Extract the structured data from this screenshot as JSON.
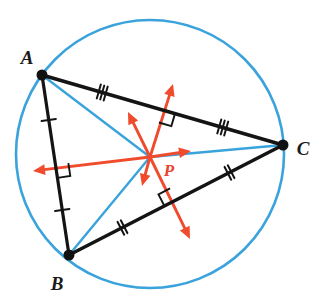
{
  "figure": {
    "background_color": "#ffffff",
    "width": 331,
    "height": 301
  },
  "colors": {
    "circle": "#3aa3dc",
    "triangle": "#141414",
    "radius": "#3aa3dc",
    "bisector": "#ef4b2c",
    "vertex_dot": "#111111",
    "label": "#1a1a1a",
    "center_label": "#e8452c"
  },
  "circle": {
    "name": "circumscribed-circle",
    "center": {
      "x": 150,
      "y": 154
    },
    "radius": 134,
    "stroke_width": 2.6
  },
  "vertices": [
    {
      "id": "A",
      "label": "A",
      "x": 42,
      "y": 75,
      "label_x": 27,
      "label_y": 64,
      "dot_radius": 5.5
    },
    {
      "id": "B",
      "label": "B",
      "x": 69,
      "y": 255,
      "label_x": 57,
      "label_y": 290,
      "dot_radius": 5.5
    },
    {
      "id": "C",
      "label": "C",
      "x": 283,
      "y": 145,
      "label_x": 303,
      "label_y": 155,
      "dot_radius": 5.5
    }
  ],
  "center_point": {
    "id": "P",
    "label": "P",
    "x": 150,
    "y": 157,
    "label_x": 169,
    "label_y": 176
  },
  "triangle_sides": [
    {
      "name": "side-AB",
      "from": "A",
      "to": "B",
      "tick_count": 1,
      "stroke_width": 3.2
    },
    {
      "name": "side-BC",
      "from": "B",
      "to": "C",
      "tick_count": 2,
      "stroke_width": 3.6
    },
    {
      "name": "side-AC",
      "from": "A",
      "to": "C",
      "tick_count": 3,
      "stroke_width": 3.6
    }
  ],
  "radii": [
    {
      "name": "radius-PA",
      "from": "P",
      "to": "A",
      "stroke_width": 2.4
    },
    {
      "name": "radius-PB",
      "from": "P",
      "to": "B",
      "stroke_width": 2.4
    },
    {
      "name": "radius-PC",
      "from": "P",
      "to": "C",
      "stroke_width": 2.4
    }
  ],
  "midpoints": [
    {
      "name": "midpoint-AB",
      "side": "AB",
      "x": 55.5,
      "y": 165
    },
    {
      "name": "midpoint-BC",
      "side": "BC",
      "x": 176,
      "y": 200
    },
    {
      "name": "midpoint-AC",
      "side": "AC",
      "x": 162.5,
      "y": 110
    }
  ],
  "perpendicular_bisectors": [
    {
      "name": "bisector-AB",
      "side": "AB",
      "arrow_long": {
        "x": 33,
        "y": 171
      },
      "arrow_short": {
        "x": 191,
        "y": 151
      },
      "arrow_heads": "both"
    },
    {
      "name": "bisector-AC",
      "side": "AC",
      "arrow_long": {
        "x": 173,
        "y": 84
      },
      "arrow_short": {
        "x": 128,
        "y": 112
      },
      "arrow_heads": "both"
    },
    {
      "name": "bisector-BC",
      "side": "BC",
      "arrow_long": {
        "x": 190,
        "y": 239
      },
      "arrow_short": {
        "x": 142,
        "y": 186
      },
      "arrow_heads": "both"
    }
  ],
  "right_angle_marks": [
    {
      "name": "right-angle-AB",
      "at_side": "AB",
      "size": 13
    },
    {
      "name": "right-angle-AC",
      "at_side": "AC",
      "size": 13
    },
    {
      "name": "right-angle-BC",
      "at_side": "BC",
      "size": 13
    }
  ],
  "chart_data": {
    "type": "diagram",
    "subtype": "euclidean-geometry",
    "title": "Circumcenter P of triangle ABC",
    "annotations": [
      "AB is bisected with single tick marks",
      "BC is bisected with double tick marks",
      "AC is bisected with triple tick marks",
      "Each perpendicular bisector meets its side at a right angle",
      "All three perpendicular bisectors concur at P",
      "PA, PB and PC are equal radii of the circumscribed circle"
    ]
  }
}
